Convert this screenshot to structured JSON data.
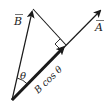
{
  "diagram": {
    "type": "vector-projection",
    "labels": {
      "vector_b": "B",
      "vector_a": "A",
      "angle": "θ",
      "projection": "B cos θ"
    },
    "colors": {
      "stroke": "#1a1a1a",
      "background": "#ffffff"
    }
  }
}
